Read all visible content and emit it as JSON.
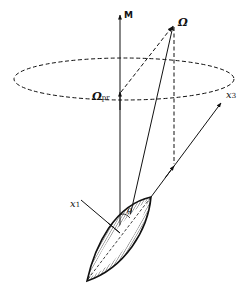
{
  "diagram": {
    "labels": {
      "M": "M",
      "omega": "Ω",
      "omega_pr": "Ω",
      "omega_pr_sub": "pr",
      "x3": "x",
      "x3_sub": "3",
      "x1": "x",
      "x1_sub": "1",
      "theta": "θ"
    },
    "colors": {
      "ink": "#111111",
      "background": "#ffffff"
    }
  }
}
